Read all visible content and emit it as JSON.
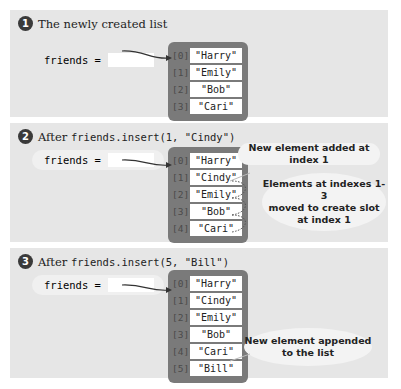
{
  "panels": [
    {
      "step_number": "1",
      "caption_text": "The newly created list",
      "caption_code": "",
      "variable_label": "friends =",
      "list": [
        {
          "index": "[0]",
          "value": "\"Harry\""
        },
        {
          "index": "[1]",
          "value": "\"Emily\""
        },
        {
          "index": "[2]",
          "value": "\"Bob\""
        },
        {
          "index": "[3]",
          "value": "\"Cari\""
        }
      ]
    },
    {
      "step_number": "2",
      "caption_text": "After",
      "caption_code": "friends.insert(1, \"Cindy\")",
      "variable_label": "friends =",
      "list": [
        {
          "index": "[0]",
          "value": "\"Harry\""
        },
        {
          "index": "[1]",
          "value": "\"Cindy\""
        },
        {
          "index": "[2]",
          "value": "\"Emily\""
        },
        {
          "index": "[3]",
          "value": "\"Bob\""
        },
        {
          "index": "[4]",
          "value": "\"Cari\""
        }
      ],
      "callouts": [
        {
          "text": "New element added at index 1"
        },
        {
          "text_lines": [
            "Elements at indexes 1-3",
            "moved to create slot",
            "at index 1"
          ]
        }
      ]
    },
    {
      "step_number": "3",
      "caption_text": "After",
      "caption_code": "friends.insert(5, \"Bill\")",
      "variable_label": "friends =",
      "list": [
        {
          "index": "[0]",
          "value": "\"Harry\""
        },
        {
          "index": "[1]",
          "value": "\"Cindy\""
        },
        {
          "index": "[2]",
          "value": "\"Emily\""
        },
        {
          "index": "[3]",
          "value": "\"Bob\""
        },
        {
          "index": "[4]",
          "value": "\"Cari\""
        },
        {
          "index": "[5]",
          "value": "\"Bill\""
        }
      ],
      "callouts": [
        {
          "text_lines": [
            "New element appended",
            "to the list"
          ]
        }
      ]
    }
  ]
}
